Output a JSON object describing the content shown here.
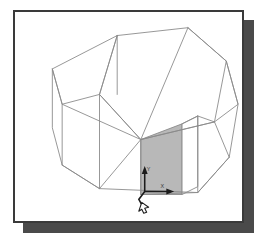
{
  "viewport": {
    "name": "3d-wireframe-viewport",
    "background_color": "#ffffff",
    "border_color": "#3a3a3a",
    "shadow_color": "#4a4a4a",
    "wire_color": "#8a8a8a",
    "shaded_face_color": "#b8b8b8",
    "axis_color": "#1c1c1c"
  },
  "model": {
    "title": "3D wireframe solid model",
    "description": "Isometric wireframe of a multi-prism solid with one shaded planar face",
    "shaded_face_label": "selected-face",
    "wire_polylines": [
      "109,25 179,18 216,52 204,116 129,133 88,86 109,25",
      "109,25 88,86 50,96 40,60 109,25",
      "40,60 50,96 50,158 88,182",
      "88,86 88,182 129,133",
      "129,133 204,116 219,150 186,186",
      "50,158 88,182 186,186 219,150",
      "179,18 216,52 228,96 204,116",
      "216,52 228,96 219,150",
      "88,86 129,133 179,18"
    ]
  },
  "axis_indicator": {
    "name": "coordinate-axis-indicator",
    "x_label": "X",
    "y_label": "Y",
    "origin_x": 146,
    "origin_y": 193
  },
  "cursor": {
    "name": "drawing-cursor",
    "visible": true
  }
}
